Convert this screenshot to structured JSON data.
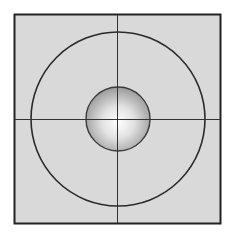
{
  "diagram": {
    "type": "concentric-target",
    "frame": {
      "x": 14,
      "y": 14,
      "width": 207,
      "height": 210,
      "fill": "#d9d9d9",
      "stroke": "#222222"
    },
    "crosshair": {
      "center_x": 117,
      "center_y": 119,
      "color": "#333333"
    },
    "outer_circle": {
      "cx": 118,
      "cy": 119,
      "r": 87,
      "stroke": "#2a2a2a"
    },
    "inner_sphere": {
      "cx": 118,
      "cy": 119,
      "r": 32,
      "stroke": "#3a3a3a",
      "highlight": "#ffffff",
      "shade": "#9a9a9a"
    }
  }
}
